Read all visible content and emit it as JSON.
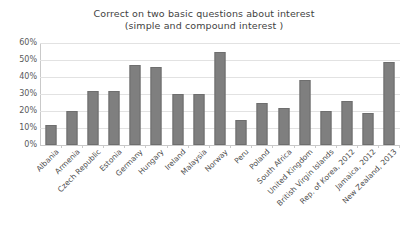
{
  "chart_data": {
    "type": "bar",
    "title": "Correct on two basic questions about interest (simple and compound interest )",
    "title_line1": "Correct on two basic questions about interest",
    "title_line2": "(simple and compound interest )",
    "xlabel": "",
    "ylabel": "",
    "ylim": [
      0,
      60
    ],
    "grid": true,
    "legend": "none",
    "bar_color": "#7f7f7f",
    "bar_edge_color": "#6e6e6e",
    "ytick_labels": [
      "60%",
      "50%",
      "40%",
      "30%",
      "20%",
      "10%",
      "0%"
    ],
    "ytick_values": [
      60,
      50,
      40,
      30,
      20,
      10,
      0
    ],
    "categories": [
      "Albania",
      "Armenia",
      "Czech Republic",
      "Estonia",
      "Germany",
      "Hungary",
      "Ireland",
      "Malaysia",
      "Norway",
      "Peru",
      "Poland",
      "South Africa",
      "United Kingdom",
      "British Virgin Islands",
      "Rep. of Korea, 2012",
      "Jamaica, 2012",
      "New Zealand, 2013"
    ],
    "values": [
      12,
      20,
      32,
      32,
      47,
      46,
      30,
      30,
      55,
      15,
      25,
      22,
      38,
      20,
      26,
      19,
      49
    ]
  }
}
